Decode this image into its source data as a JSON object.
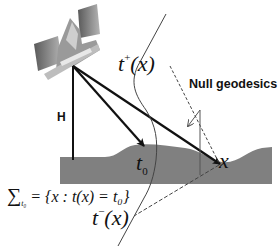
{
  "diagram": {
    "labels": {
      "height": "H",
      "null_geodesics": "Null geodesics",
      "t_plus_base": "t",
      "t_plus_sup": "+",
      "t_plus_arg": "(x)",
      "t_minus_base": "t",
      "t_minus_sup": "−",
      "t_minus_arg": "(x)",
      "t0_base": "t",
      "t0_sub": "0",
      "x_point": "x",
      "sigma_symbol": "∑",
      "sigma_sub": "t₀",
      "sigma_def": "= {x : t(x) = t₀}"
    },
    "elements": {
      "satellite": "satellite-icon",
      "ground": "terrain-surface",
      "worldline": "curved-worldline",
      "rays": [
        "ray-to-ground-left",
        "ray-to-t0",
        "ray-to-x"
      ],
      "dashed": [
        "null-geodesic-future",
        "null-geodesic-past"
      ]
    },
    "colors": {
      "ground": "#808080",
      "ink": "#111111",
      "thin_line": "#555555",
      "satellite_panel": "#8a8a8a"
    }
  }
}
